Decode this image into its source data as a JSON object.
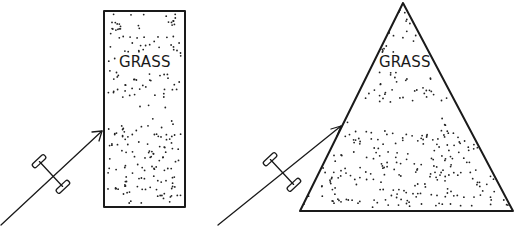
{
  "diagram": {
    "panels": [
      {
        "id": "rectangle",
        "region_label": "GRASS",
        "shape": "rectangle",
        "vehicle": "axle",
        "path": "arrow"
      },
      {
        "id": "triangle",
        "region_label": "GRASS",
        "shape": "triangle",
        "vehicle": "axle",
        "path": "arrow"
      }
    ],
    "colors": {
      "ink": "#1a1a1a",
      "background": "#ffffff"
    }
  }
}
